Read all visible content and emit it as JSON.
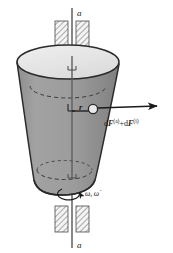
{
  "figure": {
    "name": "rotating-body-about-fixed-axis",
    "background_color": "#ffffff",
    "axis": {
      "top_label": "a",
      "bottom_label": "a",
      "line_color": "#555555"
    },
    "bearings": {
      "hatch_color": "#6e6e6e",
      "fill_color": "#f2f2f2",
      "top_label": "bearing-top",
      "bottom_label": "bearing-bottom"
    },
    "body": {
      "side_fill": "#9a9a9a",
      "top_fill": "#e6e6e6",
      "outline_color": "#2b2b2b",
      "dashed_color": "#3a3a3a"
    },
    "mass_element": {
      "fill": "#e9e9e9",
      "stroke": "#2b2b2b"
    },
    "radius_label": "r",
    "force_label": {
      "prefix_1": "d",
      "symbol_1": "F",
      "sup_1": "(a)",
      "operator": "+",
      "prefix_2": "d",
      "symbol_2": "F",
      "sup_2": "(i)"
    },
    "rotation_label": {
      "omega": "ω",
      "separator": ",",
      "omega_dot": "ω̇"
    }
  }
}
